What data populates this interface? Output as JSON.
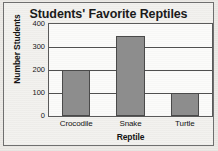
{
  "chart_data": {
    "type": "bar",
    "title": "Students' Favorite Reptiles",
    "xlabel": "Reptile",
    "ylabel": "Number Students",
    "categories": [
      "Crocodile",
      "Snake",
      "Turtle"
    ],
    "values": [
      200,
      350,
      100
    ],
    "ylim": [
      0,
      400
    ],
    "yticks": [
      0,
      100,
      200,
      300,
      400
    ],
    "ytick_labels": [
      "0",
      "100",
      "200",
      "300",
      "400"
    ],
    "grid": true,
    "grid_axis": "y",
    "legend": false,
    "orientation": "vertical",
    "bar_color": "#8d8d8d",
    "bar_edge_color": "#4a4a4a",
    "plot_background": "#fbfbfa",
    "axis_color": "#5a5a5a",
    "text_color": "#141414"
  }
}
